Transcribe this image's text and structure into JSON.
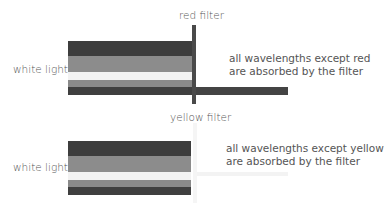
{
  "diagram": {
    "panels": [
      {
        "id": "red",
        "input_label": "white light",
        "filter_label": "red filter",
        "caption_line1": "all wavelengths except red",
        "caption_line2": "are absorbed by the filter",
        "filter_color": "#4a4a4a",
        "transmitted_color": "#4a4a4a"
      },
      {
        "id": "yellow",
        "input_label": "white light",
        "filter_label": "yellow filter",
        "caption_line1": "all wavelengths except yellow",
        "caption_line2": "are absorbed by the filter",
        "filter_color": "#f4f4f4",
        "transmitted_color": "#f2f2f2"
      }
    ],
    "bands": [
      {
        "name": "violet-blue",
        "color": "#3d3d3d"
      },
      {
        "name": "green",
        "color": "#8c8c8c"
      },
      {
        "name": "yellow",
        "color": "#f2f2f2"
      },
      {
        "name": "orange",
        "color": "#8a8a8a"
      },
      {
        "name": "red",
        "color": "#3f3f3f"
      }
    ]
  }
}
